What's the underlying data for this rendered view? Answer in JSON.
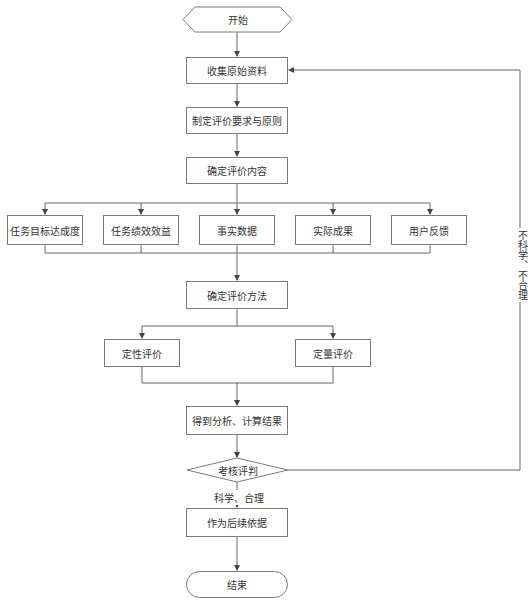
{
  "flowchart": {
    "start": {
      "label": "开始"
    },
    "steps": {
      "collect": "收集原始资料",
      "requirements": "制定评价要求与原则",
      "content": "确定评价内容",
      "method": "确定评价方法",
      "results": "得到分析、计算结果",
      "basis": "作为后续依据"
    },
    "content_items": [
      {
        "label": "任务目标达成度"
      },
      {
        "label": "任务绩效效益"
      },
      {
        "label": "事实数据"
      },
      {
        "label": "实际成果"
      },
      {
        "label": "用户反馈"
      }
    ],
    "method_items": [
      {
        "label": "定性评价"
      },
      {
        "label": "定量评价"
      }
    ],
    "decision": {
      "label": "考核评判"
    },
    "edge_labels": {
      "yes": "科学、合理",
      "no": "不科学、不合理"
    },
    "end": {
      "label": "结束"
    },
    "colors": {
      "line": "#555555",
      "border": "#7a7a7a",
      "text": "#333333"
    }
  }
}
